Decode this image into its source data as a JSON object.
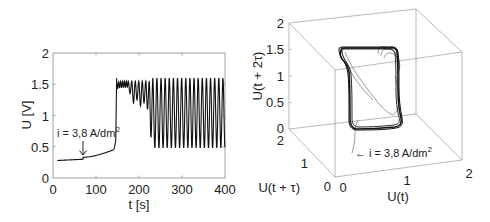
{
  "chart_data": [
    {
      "type": "line",
      "title": "",
      "xlabel": "t [s]",
      "ylabel": "U [V]",
      "xlim": [
        0,
        400
      ],
      "ylim": [
        0,
        2
      ],
      "xticks": [
        "0",
        "100",
        "200",
        "300",
        "400"
      ],
      "yticks": [
        "0",
        "0.5",
        "1",
        "1.5",
        "2"
      ],
      "grid": false,
      "annotation": {
        "text": "i = 3,8 A/dm",
        "superscript": "2",
        "arrow_at_t": 70,
        "arrow_at_U": 0.31
      },
      "series": [
        {
          "name": "U(t)",
          "phases": [
            {
              "t_start": 10,
              "t_end": 70,
              "U": [
                0.28,
                0.3
              ],
              "description": "flat"
            },
            {
              "t_start": 70,
              "t_end": 140,
              "U": [
                0.33,
                0.45
              ],
              "description": "slow rise"
            },
            {
              "t_start": 140,
              "t_end": 146,
              "U": [
                0.45,
                0.62
              ],
              "description": "steep rise"
            },
            {
              "t_start": 146,
              "t_end": 148,
              "U": [
                0.62,
                1.6
              ],
              "description": "jump"
            },
            {
              "t_start": 148,
              "t_end": 175,
              "U_max": 1.55,
              "U_min": 1.45,
              "description": "small wiggles"
            },
            {
              "t_start": 175,
              "t_end": 232,
              "U_max": 1.55,
              "U_min_sequence": [
                1.35,
                1.2,
                1.25,
                1.15,
                1.2,
                1.1,
                0.65
              ],
              "description": "growing oscillations"
            },
            {
              "t_start": 232,
              "t_end": 400,
              "U_max": 1.6,
              "U_min": 0.48,
              "period_s": 9.6,
              "description": "relaxation oscillations"
            }
          ]
        }
      ]
    },
    {
      "type": "line3d",
      "title": "",
      "xlabel": "U(t)",
      "ylabel": "U(t + τ)",
      "zlabel": "U(t + 2τ)",
      "xlim": [
        0,
        2
      ],
      "ylim": [
        0,
        2
      ],
      "zlim": [
        0,
        2
      ],
      "xticks": [
        "0",
        "1",
        "2"
      ],
      "yticks": [
        "0",
        "1",
        "2"
      ],
      "zticks": [
        "0",
        "0.5",
        "1",
        "1.5",
        "2"
      ],
      "grid": false,
      "annotation": {
        "text": "← i = 3,8 A/dm",
        "superscript": "2"
      },
      "description": "Reconstructed phase-space attractor: dense limit cycle loop spanning U≈0.5–1.6 on each axis, with a thin transient trajectory spiraling in from the initial point near U≈0.3."
    }
  ]
}
